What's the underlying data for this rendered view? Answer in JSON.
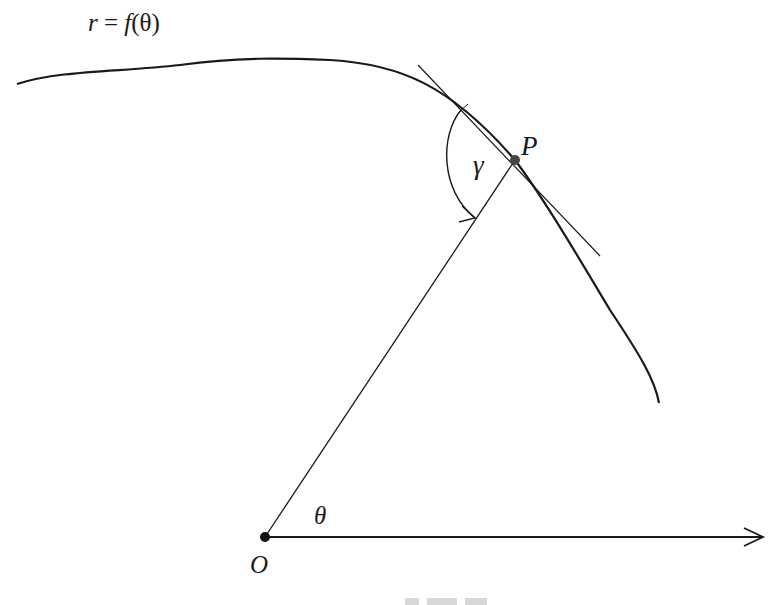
{
  "figure": {
    "labels": {
      "curve_eq_r": "r",
      "curve_eq_rest": " = ",
      "curve_eq_f": "f",
      "curve_eq_arg": "(θ)",
      "point_P": "P",
      "angle_gamma": "γ",
      "angle_theta": "θ",
      "origin_O": "O"
    },
    "colors": {
      "stroke": "#1a1a1a",
      "point": "#444444",
      "background": "#ffffff"
    },
    "caption_visible": "partially cut off (illegible)"
  }
}
